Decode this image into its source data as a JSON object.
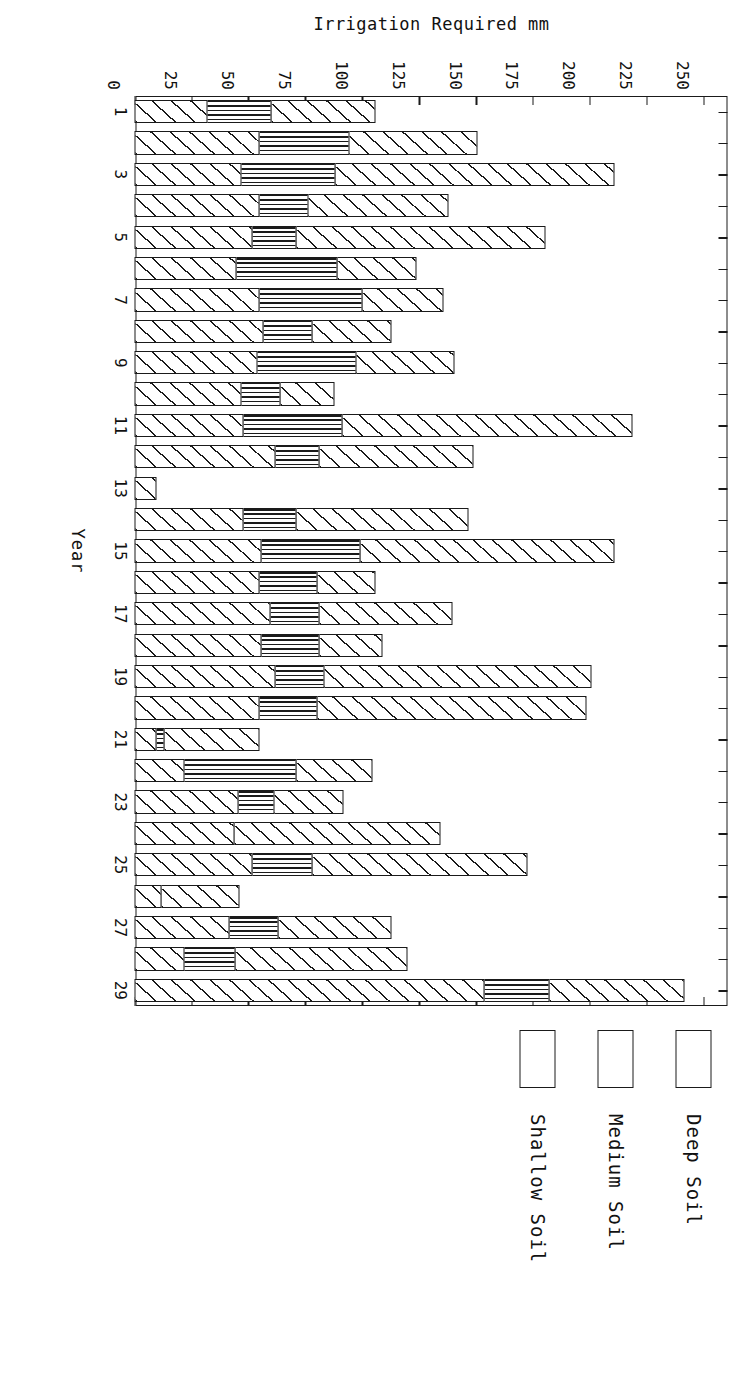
{
  "chart_data": {
    "type": "bar",
    "orientation": "horizontal-stacked",
    "title": "",
    "xlabel": "Year",
    "ylabel": "Irrigation Required mm",
    "value_axis_ticks": [
      0,
      25,
      50,
      75,
      100,
      125,
      150,
      175,
      200,
      225,
      250
    ],
    "value_axis_range": [
      0,
      260
    ],
    "category_axis_ticks": [
      1,
      3,
      5,
      7,
      9,
      11,
      13,
      15,
      17,
      19,
      21,
      23,
      25,
      27,
      29
    ],
    "categories": [
      1,
      2,
      3,
      4,
      5,
      6,
      7,
      8,
      9,
      10,
      11,
      12,
      13,
      14,
      15,
      16,
      17,
      18,
      19,
      20,
      21,
      22,
      23,
      24,
      25,
      26,
      27,
      28,
      29
    ],
    "grid": false,
    "legend_position": "right",
    "series": [
      {
        "name": "Shallow Soil",
        "fill": "diagonal-hatch",
        "values": [
          32,
          55,
          47,
          55,
          52,
          45,
          55,
          57,
          54,
          47,
          48,
          62,
          10,
          48,
          56,
          55,
          60,
          56,
          62,
          55,
          10,
          22,
          46,
          44,
          52,
          12,
          42,
          22,
          154
        ]
      },
      {
        "name": "Medium Soil",
        "fill": "vertical-hatch",
        "values": [
          29,
          40,
          42,
          22,
          20,
          45,
          46,
          22,
          44,
          18,
          44,
          20,
          0,
          24,
          44,
          26,
          22,
          26,
          22,
          26,
          4,
          50,
          16,
          0,
          27,
          0,
          22,
          23,
          29
        ]
      },
      {
        "name": "Deep Soil",
        "fill": "diagonal-hatch",
        "values": [
          46,
          57,
          123,
          62,
          110,
          35,
          36,
          35,
          44,
          24,
          128,
          68,
          0,
          76,
          112,
          26,
          59,
          28,
          118,
          119,
          42,
          34,
          31,
          91,
          95,
          35,
          50,
          76,
          60
        ]
      }
    ]
  },
  "legend": {
    "items": [
      {
        "label": "Deep Soil",
        "fill": "diagonal-hatch"
      },
      {
        "label": "Medium Soil",
        "fill": "vertical-hatch"
      },
      {
        "label": "Shallow Soil",
        "fill": "diagonal-hatch"
      }
    ]
  },
  "axes": {
    "value_axis_title": "Irrigation Required mm",
    "category_axis_title": "Year"
  },
  "colors": {
    "ink": "#1a1a1a",
    "paper": "#ffffff"
  }
}
